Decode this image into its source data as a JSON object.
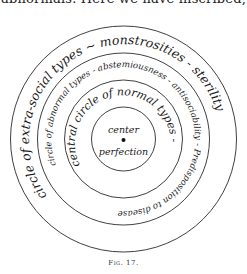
{
  "page_header_text": "abnormals.   Here we have inscribed,",
  "diagram": {
    "rings": [
      {
        "name": "outer",
        "label": "circle of extra-social types ~ monstrosities - sterility"
      },
      {
        "name": "middle",
        "label": "circle of abnormal types - abstemiousness - antisociability - Predisposition to disease"
      },
      {
        "name": "inner",
        "label": "central circle of normal types -"
      }
    ],
    "center": {
      "top_label": "center",
      "bottom_label": "perfection"
    }
  },
  "caption": "Fig. 17."
}
